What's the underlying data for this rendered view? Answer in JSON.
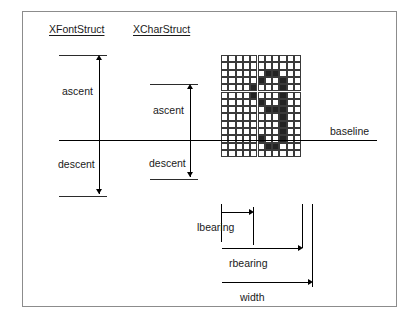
{
  "diagram": {
    "title_left": "XFontStruct",
    "title_right": "XCharStruct",
    "labels": {
      "font_ascent": "ascent",
      "font_descent": "descent",
      "char_ascent": "ascent",
      "char_descent": "descent",
      "baseline": "baseline",
      "lbearing": "lbearing",
      "rbearing": "rbearing",
      "width": "width"
    },
    "colors": {
      "frame": "#8c8c8c",
      "line": "#000000",
      "grid_line": "#3a3a3a",
      "pixel_on": "#232323",
      "pixel_off": "#ffffff",
      "text": "#1a1a1a",
      "background": "#ffffff"
    },
    "glyph": {
      "description": "bitmap of the digit nine drawn on a pixel grid",
      "columns": 11,
      "rows": 14,
      "cell_size": 7.3,
      "baseline_row_index": 9,
      "on_cells": [
        [
          2,
          6
        ],
        [
          2,
          7
        ],
        [
          3,
          5
        ],
        [
          3,
          8
        ],
        [
          4,
          4
        ],
        [
          4,
          8
        ],
        [
          5,
          4
        ],
        [
          5,
          8
        ],
        [
          6,
          5
        ],
        [
          6,
          8
        ],
        [
          7,
          6
        ],
        [
          7,
          7
        ],
        [
          7,
          8
        ],
        [
          8,
          8
        ],
        [
          9,
          8
        ],
        [
          10,
          8
        ],
        [
          11,
          5
        ],
        [
          11,
          8
        ],
        [
          12,
          6
        ],
        [
          12,
          7
        ]
      ]
    }
  }
}
